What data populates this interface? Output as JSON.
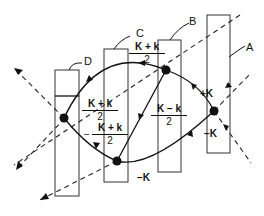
{
  "diagram": {
    "labels": {
      "A": "A",
      "B": "B",
      "C": "C",
      "D": "D"
    },
    "fractions": {
      "top": {
        "num": "K + k",
        "den": "2"
      },
      "left_upper": {
        "num": "K + k",
        "den": "2"
      },
      "left_lower": {
        "sign": "−",
        "num": "K + k",
        "den": "2"
      },
      "middle": {
        "num": "K − k",
        "den": "2"
      }
    },
    "edge_labels": {
      "plus_K": "+K",
      "minus_K_right": "−K",
      "minus_K_bottom": "−K"
    },
    "elements": {
      "slabs": 4,
      "nodes": 4,
      "dashed_lines": 2
    }
  }
}
